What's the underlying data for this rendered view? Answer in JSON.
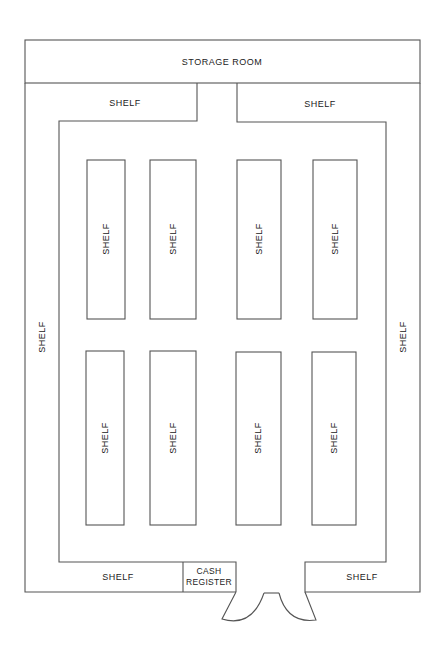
{
  "diagram": {
    "line_color": "#555555",
    "rooms": {
      "storage_room": "STORAGE ROOM",
      "cash_register_line1": "CASH",
      "cash_register_line2": "REGISTER"
    },
    "perimeter_shelves": {
      "top_left": "SHELF",
      "top_right": "SHELF",
      "left": "SHELF",
      "right": "SHELF",
      "bottom_left": "SHELF",
      "bottom_right": "SHELF"
    },
    "aisle_shelves": {
      "upper": [
        "SHELF",
        "SHELF",
        "SHELF",
        "SHELF"
      ],
      "lower": [
        "SHELF",
        "SHELF",
        "SHELF",
        "SHELF"
      ]
    },
    "entrance": {
      "doors": [
        "left-door",
        "right-door"
      ]
    }
  }
}
